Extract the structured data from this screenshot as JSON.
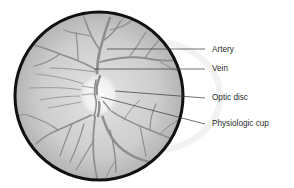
{
  "diagram": {
    "labels": [
      {
        "id": "artery",
        "text": "Artery",
        "x": 212,
        "y": 46,
        "line": [
          107,
          49,
          205,
          49
        ]
      },
      {
        "id": "vein",
        "text": "Vein",
        "x": 212,
        "y": 65,
        "line": [
          95,
          69,
          205,
          69
        ]
      },
      {
        "id": "optic-disc",
        "text": "Optic disc",
        "x": 212,
        "y": 94,
        "line": [
          115,
          91,
          205,
          98
        ]
      },
      {
        "id": "physiologic-cup",
        "text": "Physiologic cup",
        "x": 212,
        "y": 120,
        "line": [
          101,
          97,
          205,
          124
        ]
      }
    ],
    "colors": {
      "fundus_outline": "#111111",
      "fundus_fill_center": "#e2e2e2",
      "fundus_fill_edge": "#b5b5b5",
      "optic_disc": "#f4f4f4",
      "vessel": "#8e8e8e",
      "leader_line": "#333333",
      "label_text": "#2a2a2a"
    }
  }
}
